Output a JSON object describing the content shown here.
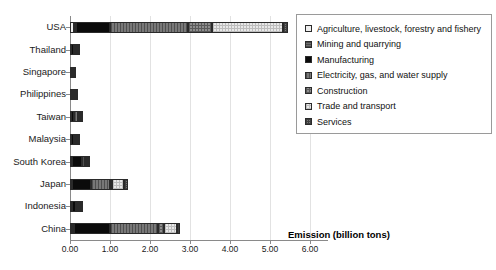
{
  "chart_data": {
    "type": "bar",
    "orientation": "horizontal",
    "stacked": true,
    "title": "",
    "xlabel": "Emission (billion tons)",
    "ylabel": "",
    "xlim": [
      0,
      6
    ],
    "xticks": [
      "0.00",
      "1.00",
      "2.00",
      "3.00",
      "4.00",
      "5.00",
      "6.00"
    ],
    "xtick_values": [
      0,
      1,
      2,
      3,
      4,
      5,
      6
    ],
    "grid": true,
    "legend_position": "top-right",
    "categories": [
      "USA",
      "Thailand",
      "Singapore",
      "Philippines",
      "Taiwan",
      "Malaysia",
      "South Korea",
      "Japan",
      "Indonesia",
      "China"
    ],
    "series": [
      {
        "name": "Agriculture, livestock, forestry and fishery",
        "values": [
          0.09,
          0.02,
          0.0,
          0.02,
          0.01,
          0.01,
          0.02,
          0.03,
          0.03,
          0.06
        ]
      },
      {
        "name": "Mining and quarrying",
        "values": [
          0.05,
          0.01,
          0.0,
          0.01,
          0.01,
          0.02,
          0.02,
          0.02,
          0.02,
          0.05
        ]
      },
      {
        "name": "Manufacturing",
        "values": [
          0.85,
          0.07,
          0.04,
          0.05,
          0.09,
          0.06,
          0.25,
          0.48,
          0.1,
          0.9
        ]
      },
      {
        "name": "Electricity, gas, and water supply",
        "values": [
          1.95,
          0.06,
          0.02,
          0.03,
          0.09,
          0.06,
          0.09,
          0.48,
          0.06,
          1.18
        ]
      },
      {
        "name": "Construction",
        "values": [
          0.62,
          0.01,
          0.01,
          0.01,
          0.02,
          0.01,
          0.02,
          0.05,
          0.02,
          0.15
        ]
      },
      {
        "name": "Trade and transport",
        "values": [
          1.76,
          0.04,
          0.04,
          0.03,
          0.05,
          0.05,
          0.06,
          0.3,
          0.05,
          0.33
        ]
      },
      {
        "name": "Services",
        "values": [
          0.13,
          0.01,
          0.01,
          0.01,
          0.01,
          0.01,
          0.02,
          0.09,
          0.02,
          0.08
        ]
      }
    ],
    "totals": [
      "5.45",
      "0.22",
      "0.12",
      "0.16",
      "0.28",
      "0.22",
      "0.48",
      "1.45",
      "0.30",
      "2.75"
    ]
  },
  "legend": {
    "items": [
      {
        "label": "Agriculture, livestock, forestry and fishery",
        "fill": "f-agri"
      },
      {
        "label": "Mining and quarrying",
        "fill": "f-mining"
      },
      {
        "label": "Manufacturing",
        "fill": "f-manu"
      },
      {
        "label": "Electricity, gas, and water supply",
        "fill": "f-elec"
      },
      {
        "label": "Construction",
        "fill": "f-constr"
      },
      {
        "label": "Trade and transport",
        "fill": "f-trade"
      },
      {
        "label": "Services",
        "fill": "f-serv"
      }
    ]
  },
  "colors": {
    "axis": "#8a8a8a",
    "grid": "#e2e2e2",
    "text": "#1a1a1a",
    "legend_border": "#9a9a9a"
  }
}
